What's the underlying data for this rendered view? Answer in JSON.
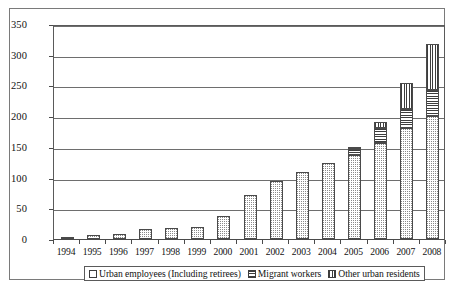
{
  "chart_data": {
    "type": "bar",
    "subtype": "stacked-column",
    "title": "",
    "subtitle": "",
    "xlabel": "",
    "ylabel": "",
    "ylim": [
      0,
      350
    ],
    "ytick_step": 50,
    "yticks": [
      0,
      50,
      100,
      150,
      200,
      250,
      300,
      350
    ],
    "ytick_labels": [
      "0",
      "50",
      "100",
      "150",
      "200",
      "250",
      "300",
      "350"
    ],
    "grid": true,
    "grid_axis": "y",
    "legend_position": "bottom",
    "categories": [
      "1994",
      "1995",
      "1996",
      "1997",
      "1998",
      "1999",
      "2000",
      "2001",
      "2002",
      "2003",
      "2004",
      "2005",
      "2006",
      "2007",
      "2008"
    ],
    "series": [
      {
        "name": "Urban employees (Including retirees)",
        "pattern": "dots",
        "values": [
          3,
          6,
          8,
          17,
          18,
          20,
          38,
          72,
          94,
          109,
          124,
          137,
          157,
          180,
          200
        ]
      },
      {
        "name": "Migrant workers",
        "pattern": "horizontal-lines",
        "values": [
          0,
          0,
          0,
          0,
          0,
          0,
          0,
          0,
          0,
          0,
          0,
          9,
          24,
          31,
          43
        ]
      },
      {
        "name": "Other urban residents",
        "pattern": "vertical-lines",
        "values": [
          0,
          0,
          0,
          0,
          0,
          0,
          0,
          0,
          0,
          0,
          0,
          3,
          10,
          43,
          75
        ]
      }
    ],
    "totals": [
      3,
      6,
      8,
      17,
      18,
      20,
      38,
      72,
      94,
      109,
      124,
      149,
      191,
      254,
      318
    ]
  },
  "legend": {
    "items": [
      {
        "label": "Urban employees (Including retirees)",
        "swatch": "dots-swatch"
      },
      {
        "label": "Migrant workers",
        "swatch": "horizontal-lines-swatch"
      },
      {
        "label": "Other urban residents",
        "swatch": "vertical-lines-swatch"
      }
    ]
  },
  "colors": {
    "background": "#ffffff",
    "frame": "#7a7a7a",
    "axis": "#4a4a4a",
    "gridline": "#6e6e6e",
    "pattern_ink": "#3d3d3d",
    "dot_ink": "#8a8a8a",
    "text": "#111111"
  }
}
